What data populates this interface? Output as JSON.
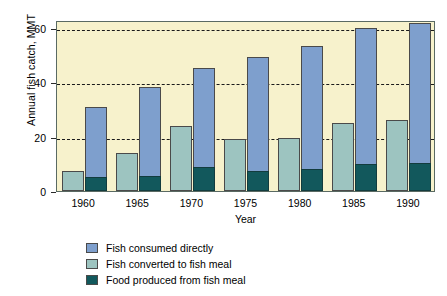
{
  "chart_data": {
    "type": "bar",
    "title": "",
    "xlabel": "Year",
    "ylabel": "Annual fish catch, MMT",
    "categories": [
      "1960",
      "1965",
      "1970",
      "1975",
      "1980",
      "1985",
      "1990"
    ],
    "ylim": [
      0,
      63
    ],
    "yticks": [
      0,
      20,
      40,
      60
    ],
    "ytick_labels": [
      "0",
      "20",
      "40",
      "60"
    ],
    "grid": "horizontal-dashed",
    "legend_position": "below-left",
    "series": [
      {
        "name": "Fish consumed directly",
        "color": "#7e9fcd",
        "values": [
          31,
          38.5,
          45.5,
          49.5,
          53.5,
          60,
          62
        ]
      },
      {
        "name": "Fish converted to fish meal",
        "color": "#9dc4c0",
        "values": [
          7.5,
          14,
          24,
          19,
          19.5,
          25,
          26
        ]
      },
      {
        "name": "Food produced from fish meal",
        "color": "#12585c",
        "values": [
          5,
          5.5,
          9,
          7.5,
          8,
          10,
          10.5
        ]
      }
    ]
  },
  "colors": {
    "plot_background": "#f7f2cc",
    "frame": "#5a6a63",
    "gridline": "#1a1a1a",
    "page_background": "#ffffff"
  }
}
